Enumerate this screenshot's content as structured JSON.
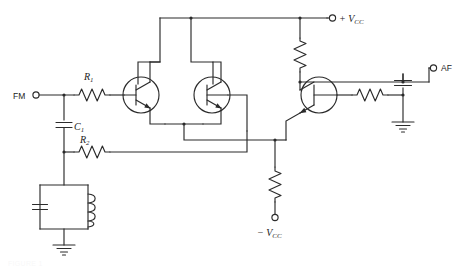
{
  "figure": {
    "kind": "circuit-schematic",
    "background_color": "#ffffff",
    "line_color": "#2b2b2b",
    "width": 461,
    "height": 271
  },
  "terminals": [
    {
      "id": "fm_in",
      "label": "FM",
      "x": 36,
      "y": 95,
      "label_x": 14,
      "label_y": 98,
      "style": "sans"
    },
    {
      "id": "vcc_pos",
      "label": "+ V",
      "sub": "CC",
      "x": 331,
      "y": 18,
      "label_x": 339,
      "label_y": 22,
      "style": "italic"
    },
    {
      "id": "af_out",
      "label": "AF",
      "x": 432,
      "y": 68,
      "label_x": 440,
      "label_y": 71,
      "style": "sans"
    },
    {
      "id": "vcc_neg",
      "label": "− V",
      "sub": "CC",
      "x": 279,
      "y": 217,
      "label_x": 258,
      "label_y": 234,
      "style": "italic"
    }
  ],
  "components": [
    {
      "id": "r1",
      "type": "resistor",
      "label": "R",
      "sub": "1",
      "label_x": 85,
      "label_y": 77,
      "orientation": "horizontal"
    },
    {
      "id": "r2",
      "type": "resistor",
      "label": "R",
      "sub": "2",
      "label_x": 81,
      "label_y": 150,
      "orientation": "horizontal"
    },
    {
      "id": "r3",
      "type": "resistor",
      "label": "",
      "sub": "",
      "label_x": 0,
      "label_y": 0,
      "orientation": "vertical",
      "note": "collector load to +Vcc"
    },
    {
      "id": "r4",
      "type": "resistor",
      "label": "",
      "sub": "",
      "label_x": 0,
      "label_y": 0,
      "orientation": "vertical",
      "note": "tail resistor to -Vcc"
    },
    {
      "id": "r5",
      "type": "resistor",
      "label": "",
      "sub": "",
      "label_x": 0,
      "label_y": 0,
      "orientation": "horizontal",
      "note": "AF output series resistor"
    },
    {
      "id": "c1",
      "type": "capacitor",
      "label": "C",
      "sub": "1",
      "label_x": 67,
      "label_y": 129,
      "orientation": "vertical"
    },
    {
      "id": "c2",
      "type": "capacitor",
      "label": "",
      "sub": "",
      "label_x": 0,
      "label_y": 0,
      "orientation": "vertical",
      "note": "tank capacitor"
    },
    {
      "id": "c3",
      "type": "capacitor",
      "label": "",
      "sub": "",
      "label_x": 0,
      "label_y": 0,
      "orientation": "vertical",
      "note": "AF bypass capacitor"
    },
    {
      "id": "l1",
      "type": "inductor",
      "label": "",
      "sub": "",
      "label_x": 0,
      "label_y": 0,
      "orientation": "vertical",
      "note": "tank inductor"
    },
    {
      "id": "q1",
      "type": "npn-transistor",
      "label": "",
      "note": "differential pair left"
    },
    {
      "id": "q2",
      "type": "npn-transistor",
      "label": "",
      "note": "differential pair right"
    },
    {
      "id": "q3",
      "type": "npn-transistor",
      "label": "",
      "note": "output emitter follower"
    }
  ],
  "grounds": [
    {
      "id": "gnd_tank",
      "x": 64,
      "y": 235
    },
    {
      "id": "gnd_af",
      "x": 403,
      "y": 133
    }
  ],
  "caption": {
    "text": "FIGURE 1",
    "visible": false
  }
}
